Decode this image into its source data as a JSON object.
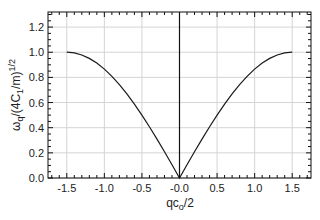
{
  "chart_data": {
    "type": "line",
    "title": "",
    "xlabel": "qc_o/2",
    "ylabel": "ω_q/(4C_1/m)^1/2",
    "xlabel_parts": {
      "main": "qc",
      "sub": "o",
      "rest": "/2"
    },
    "ylabel_parts": {
      "w": "ω",
      "wsub": "q",
      "mid": "/(4C",
      "csub": "1",
      "end": "/m)",
      "sup": "1/2"
    },
    "xlim": [
      -1.75,
      1.75
    ],
    "ylim": [
      0.0,
      1.32
    ],
    "xticks": [
      "-1.5",
      "-1.0",
      "-0.5",
      "-0.0",
      "0.5",
      "1.0",
      "1.5"
    ],
    "xtick_values": [
      -1.5,
      -1.0,
      -0.5,
      0.0,
      0.5,
      1.0,
      1.5
    ],
    "yticks": [
      "0.0",
      "0.2",
      "0.4",
      "0.6",
      "0.8",
      "1.0",
      "1.2"
    ],
    "ytick_values": [
      0.0,
      0.2,
      0.4,
      0.6,
      0.8,
      1.0,
      1.2
    ],
    "grid": true,
    "vertical_line_at": 0.0,
    "series": [
      {
        "name": "dispersion",
        "x": [
          -1.5,
          -1.4,
          -1.3,
          -1.2,
          -1.1,
          -1.0,
          -0.9,
          -0.8,
          -0.7,
          -0.6,
          -0.5,
          -0.4,
          -0.3,
          -0.2,
          -0.1,
          0.0,
          0.1,
          0.2,
          0.3,
          0.4,
          0.5,
          0.6,
          0.7,
          0.8,
          0.9,
          1.0,
          1.1,
          1.2,
          1.3,
          1.4,
          1.5
        ],
        "values": [
          1.0,
          0.995,
          0.978,
          0.951,
          0.914,
          0.866,
          0.809,
          0.743,
          0.669,
          0.588,
          0.5,
          0.407,
          0.309,
          0.208,
          0.105,
          0.0,
          0.105,
          0.208,
          0.309,
          0.407,
          0.5,
          0.588,
          0.669,
          0.743,
          0.809,
          0.866,
          0.914,
          0.951,
          0.978,
          0.995,
          1.0
        ],
        "color": "#1a1a1a"
      }
    ]
  }
}
